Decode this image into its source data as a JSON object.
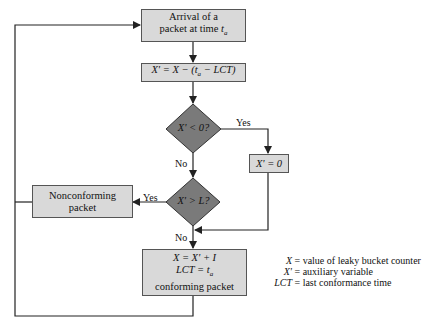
{
  "nodes": {
    "arrival": {
      "line1": "Arrival of a",
      "line2": "packet at time t",
      "sub": "a"
    },
    "compute": {
      "text": "X' = X − (ta − LCT)"
    },
    "decision1": {
      "text": "X' < 0?"
    },
    "set_zero": {
      "text": "X' = 0"
    },
    "decision2": {
      "text": "X' > L?"
    },
    "nonconforming": {
      "line1": "Nonconforming",
      "line2": "packet"
    },
    "conforming": {
      "line1": "X = X' + I",
      "line2": "LCT = ta",
      "line3": "conforming packet"
    }
  },
  "edges": {
    "d1_yes": "Yes",
    "d1_no": "No",
    "d2_yes": "Yes",
    "d2_no": "No"
  },
  "legend": [
    {
      "key": "X",
      "value": "= value of leaky bucket counter"
    },
    {
      "key": "X'",
      "value": "= auxiliary variable"
    },
    {
      "key": "LCT",
      "value": "= last conformance time"
    }
  ],
  "colors": {
    "box_fill": "#d9d9d9",
    "diamond_fill": "#7a7a7a",
    "line": "#222222"
  }
}
